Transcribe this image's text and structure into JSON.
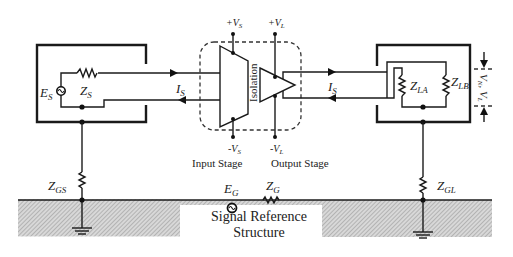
{
  "diagram": {
    "source_box": {
      "source_label": "E",
      "source_sub": "S",
      "impedance_label": "Z",
      "impedance_sub": "S"
    },
    "current_left": {
      "label": "I",
      "sub": "S"
    },
    "current_right": {
      "label": "I",
      "sub": "S"
    },
    "isolation": {
      "barrier_label": "Isolation",
      "input_stage_label": "Input Stage",
      "output_stage_label": "Output Stage",
      "vs_plus": "+V",
      "vs_plus_sub": "S",
      "vl_plus": "+V",
      "vl_plus_sub": "L",
      "vs_minus": "-V",
      "vs_minus_sub": "S",
      "vl_minus": "-V",
      "vl_minus_sub": "L"
    },
    "load_box": {
      "za_label": "Z",
      "za_sub": "LA",
      "zb_label": "Z",
      "zb_sub": "LB",
      "noise_label": "V",
      "noise_sub": "N",
      "load_v_label": "V",
      "load_v_sub": "L"
    },
    "ground": {
      "zgs_label": "Z",
      "zgs_sub": "GS",
      "zgl_label": "Z",
      "zgl_sub": "GL",
      "eg_label": "E",
      "eg_sub": "G",
      "zg_label": "Z",
      "zg_sub": "G",
      "reference_line1": "Signal Reference",
      "reference_line2": "Structure"
    },
    "colors": {
      "line": "#1a1a1a",
      "hatch": "#b5b5b5",
      "background": "#ffffff"
    }
  }
}
